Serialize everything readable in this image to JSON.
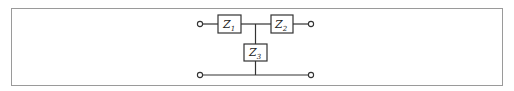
{
  "diagram": {
    "type": "T-network circuit",
    "components": [
      {
        "id": "Z1",
        "symbol": "Z",
        "subscript": "1",
        "position": "series-left"
      },
      {
        "id": "Z2",
        "symbol": "Z",
        "subscript": "2",
        "position": "series-right"
      },
      {
        "id": "Z3",
        "symbol": "Z",
        "subscript": "3",
        "position": "shunt"
      }
    ],
    "terminals": [
      "input-top",
      "output-top",
      "input-bottom",
      "output-bottom"
    ],
    "colors": {
      "wire": "#333333",
      "frame": "#9a9a9a",
      "background": "#ffffff"
    }
  }
}
